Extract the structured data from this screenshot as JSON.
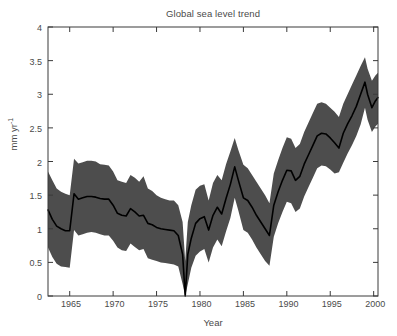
{
  "chart_data": {
    "type": "area",
    "title": "Global sea level trend",
    "xlabel": "Year",
    "ylabel": "mm yr-1",
    "ylabel_base": "mm yr",
    "ylabel_exponent": "-1",
    "xlim": [
      1962.5,
      2000.5
    ],
    "ylim": [
      0,
      4
    ],
    "grid": false,
    "legend": null,
    "xticks": [
      1965,
      1970,
      1975,
      1980,
      1985,
      1990,
      1995,
      2000
    ],
    "xtick_labels": [
      "1965",
      "1970",
      "1975",
      "1980",
      "1985",
      "1990",
      "1995",
      "2000"
    ],
    "yticks": [
      0,
      0.5,
      1,
      1.5,
      2,
      2.5,
      3,
      3.5,
      4
    ],
    "ytick_labels": [
      "0",
      "0.5",
      "1",
      "1.5",
      "2",
      "2.5",
      "3",
      "3.5",
      "4"
    ],
    "band_color": "#4d4d4d",
    "line_color": "#000000",
    "axis_color": "#3a3a3a",
    "background_color": "#ffffff",
    "x": [
      1962.5,
      1963,
      1963.5,
      1964,
      1964.5,
      1965,
      1965.5,
      1966,
      1966.5,
      1967,
      1967.5,
      1968,
      1968.5,
      1969,
      1969.5,
      1970,
      1970.5,
      1971,
      1971.5,
      1972,
      1972.5,
      1973,
      1973.5,
      1974,
      1974.5,
      1975,
      1975.5,
      1976,
      1976.5,
      1977,
      1977.5,
      1978,
      1978.3,
      1978.6,
      1979,
      1979.5,
      1980,
      1980.5,
      1981,
      1981.5,
      1982,
      1982.5,
      1983,
      1983.5,
      1984,
      1984.4,
      1985,
      1985.5,
      1986,
      1986.5,
      1987,
      1987.5,
      1988,
      1988.5,
      1989,
      1989.5,
      1990,
      1990.5,
      1991,
      1991.5,
      1992,
      1992.5,
      1993,
      1993.5,
      1994,
      1994.5,
      1995,
      1995.5,
      1996,
      1996.5,
      1997,
      1997.5,
      1998,
      1998.5,
      1999,
      1999.3,
      1999.8,
      2000.2,
      2000.5
    ],
    "series": [
      {
        "name": "trend",
        "role": "center-line",
        "values": [
          1.28,
          1.14,
          1.04,
          1.0,
          0.97,
          0.97,
          1.52,
          1.44,
          1.46,
          1.48,
          1.48,
          1.47,
          1.45,
          1.44,
          1.44,
          1.35,
          1.23,
          1.2,
          1.19,
          1.3,
          1.25,
          1.19,
          1.2,
          1.08,
          1.06,
          1.02,
          1.0,
          0.99,
          0.98,
          0.97,
          0.9,
          0.62,
          0.0,
          0.62,
          0.86,
          1.08,
          1.15,
          1.18,
          0.98,
          1.2,
          1.32,
          1.22,
          1.45,
          1.66,
          1.92,
          1.73,
          1.46,
          1.42,
          1.32,
          1.2,
          1.1,
          1.0,
          0.9,
          1.35,
          1.55,
          1.72,
          1.87,
          1.86,
          1.72,
          1.78,
          1.96,
          2.1,
          2.24,
          2.38,
          2.42,
          2.41,
          2.35,
          2.28,
          2.2,
          2.42,
          2.56,
          2.68,
          2.82,
          3.0,
          3.18,
          3.0,
          2.8,
          2.9,
          2.95
        ]
      },
      {
        "name": "upper bound",
        "role": "band-upper",
        "values": [
          1.85,
          1.72,
          1.6,
          1.55,
          1.52,
          1.5,
          2.04,
          1.97,
          1.99,
          2.01,
          2.01,
          2.0,
          1.96,
          1.95,
          1.94,
          1.85,
          1.72,
          1.7,
          1.68,
          1.8,
          1.76,
          1.7,
          1.78,
          1.6,
          1.56,
          1.5,
          1.46,
          1.44,
          1.42,
          1.42,
          1.35,
          1.1,
          0.52,
          1.1,
          1.35,
          1.58,
          1.64,
          1.66,
          1.42,
          1.68,
          1.8,
          1.72,
          1.96,
          2.15,
          2.35,
          2.18,
          1.95,
          1.9,
          1.8,
          1.7,
          1.6,
          1.5,
          1.38,
          1.82,
          2.02,
          2.2,
          2.36,
          2.34,
          2.2,
          2.26,
          2.44,
          2.58,
          2.72,
          2.86,
          2.88,
          2.86,
          2.8,
          2.74,
          2.66,
          2.86,
          3.0,
          3.14,
          3.28,
          3.42,
          3.55,
          3.38,
          3.2,
          3.28,
          3.32
        ]
      },
      {
        "name": "lower bound",
        "role": "band-lower",
        "values": [
          0.72,
          0.58,
          0.48,
          0.44,
          0.43,
          0.42,
          0.98,
          0.9,
          0.92,
          0.94,
          0.95,
          0.94,
          0.92,
          0.9,
          0.9,
          0.82,
          0.72,
          0.68,
          0.67,
          0.78,
          0.73,
          0.68,
          0.7,
          0.56,
          0.54,
          0.52,
          0.5,
          0.49,
          0.48,
          0.47,
          0.44,
          0.18,
          0.0,
          0.18,
          0.42,
          0.6,
          0.66,
          0.7,
          0.5,
          0.72,
          0.84,
          0.74,
          0.96,
          1.16,
          1.46,
          1.28,
          0.98,
          0.94,
          0.84,
          0.72,
          0.62,
          0.52,
          0.45,
          0.88,
          1.08,
          1.25,
          1.4,
          1.38,
          1.25,
          1.3,
          1.48,
          1.62,
          1.76,
          1.9,
          1.94,
          1.93,
          1.88,
          1.82,
          1.84,
          1.98,
          2.12,
          2.24,
          2.38,
          2.55,
          2.8,
          2.62,
          2.44,
          2.52,
          2.56
        ]
      }
    ],
    "annotations": [
      {
        "label": "minimum at ~1978.3",
        "value": 0.0
      },
      {
        "label": "local peak at ~1984",
        "value": 1.92
      },
      {
        "label": "maximum at ~1999",
        "value": 3.18
      }
    ]
  }
}
